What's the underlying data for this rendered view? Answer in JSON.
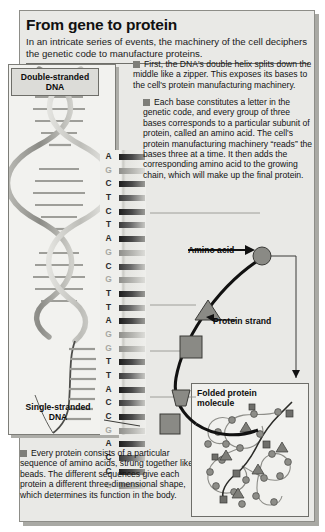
{
  "header": {
    "title": "From gene to protein",
    "deck": "In an intricate series of events, the machinery of the cell deciphers the genetic code to manufacture proteins."
  },
  "bullets": [
    {
      "id": "bullet-1",
      "text": "First, the DNA's double helix splits down the middle like a zipper. This exposes its bases to the cell's protein manufacturing machinery."
    },
    {
      "id": "bullet-2",
      "text": "Each base constitutes a letter in the genetic code, and every group of three bases corresponds to a particular subunit of protein, called an amino acid. The cell's protein manufacturing machinery “reads” the bases three at a time. It then adds the corresponding amino acid to the growing chain, which will make up the final protein."
    },
    {
      "id": "bullet-3",
      "text": "Every protein consists of a particular sequence of amino acids, strung together like beads. The different sequences give each protein a different three-dimensional shape, which determines its function in the body."
    }
  ],
  "labels": {
    "double_stranded_dna": "Double-stranded\nDNA",
    "double_stranded_dna_line1": "Double-stranded",
    "double_stranded_dna_line2": "DNA",
    "single_stranded_dna_line1": "Single-stranded",
    "single_stranded_dna_line2": "DNA",
    "amino_acid": "Amino acid",
    "protein_strand": "Protein strand",
    "folded_protein_line1": "Folded protein",
    "folded_protein_line2": "molecule"
  },
  "dna_sequence": [
    {
      "base": "A",
      "faint": false,
      "tone": "dark"
    },
    {
      "base": "G",
      "faint": true,
      "tone": "light"
    },
    {
      "base": "C",
      "faint": false,
      "tone": "dark"
    },
    {
      "base": "T",
      "faint": false,
      "tone": "mid"
    },
    {
      "base": "C",
      "faint": false,
      "tone": "dark"
    },
    {
      "base": "T",
      "faint": false,
      "tone": "mid"
    },
    {
      "base": "A",
      "faint": false,
      "tone": "dark"
    },
    {
      "base": "G",
      "faint": true,
      "tone": "light"
    },
    {
      "base": "C",
      "faint": false,
      "tone": "mid"
    },
    {
      "base": "G",
      "faint": true,
      "tone": "light"
    },
    {
      "base": "T",
      "faint": false,
      "tone": "dark"
    },
    {
      "base": "T",
      "faint": false,
      "tone": "mid"
    },
    {
      "base": "A",
      "faint": false,
      "tone": "dark"
    },
    {
      "base": "G",
      "faint": true,
      "tone": "light"
    },
    {
      "base": "G",
      "faint": true,
      "tone": "light"
    },
    {
      "base": "T",
      "faint": false,
      "tone": "dark"
    },
    {
      "base": "T",
      "faint": false,
      "tone": "mid"
    },
    {
      "base": "A",
      "faint": false,
      "tone": "dark"
    },
    {
      "base": "C",
      "faint": false,
      "tone": "mid"
    },
    {
      "base": "C",
      "faint": false,
      "tone": "dark"
    },
    {
      "base": "G",
      "faint": true,
      "tone": "light"
    },
    {
      "base": "A",
      "faint": false,
      "tone": "dark"
    },
    {
      "base": "C",
      "faint": false,
      "tone": "mid"
    },
    {
      "base": "C",
      "faint": false,
      "tone": "dark"
    },
    {
      "base": "G",
      "faint": true,
      "tone": "light"
    }
  ],
  "colors": {
    "page_background": "#ffffff",
    "panel_background": "#e9e9e6",
    "art_background": "#f2f2ef",
    "border": "#7d7d78",
    "bullet_square": "#7e7e79",
    "text": "#131313",
    "amino_shape_fill": "#8a8a85",
    "amino_shape_stroke": "#3a3a37",
    "chain_stroke": "#101010"
  },
  "amino_shapes": [
    {
      "name": "square-amino-acid",
      "shape": "square"
    },
    {
      "name": "triangle-amino-acid",
      "shape": "triangle"
    },
    {
      "name": "circle-amino-acid",
      "shape": "circle"
    },
    {
      "name": "pentagon-amino-acid",
      "shape": "pentagon"
    }
  ]
}
